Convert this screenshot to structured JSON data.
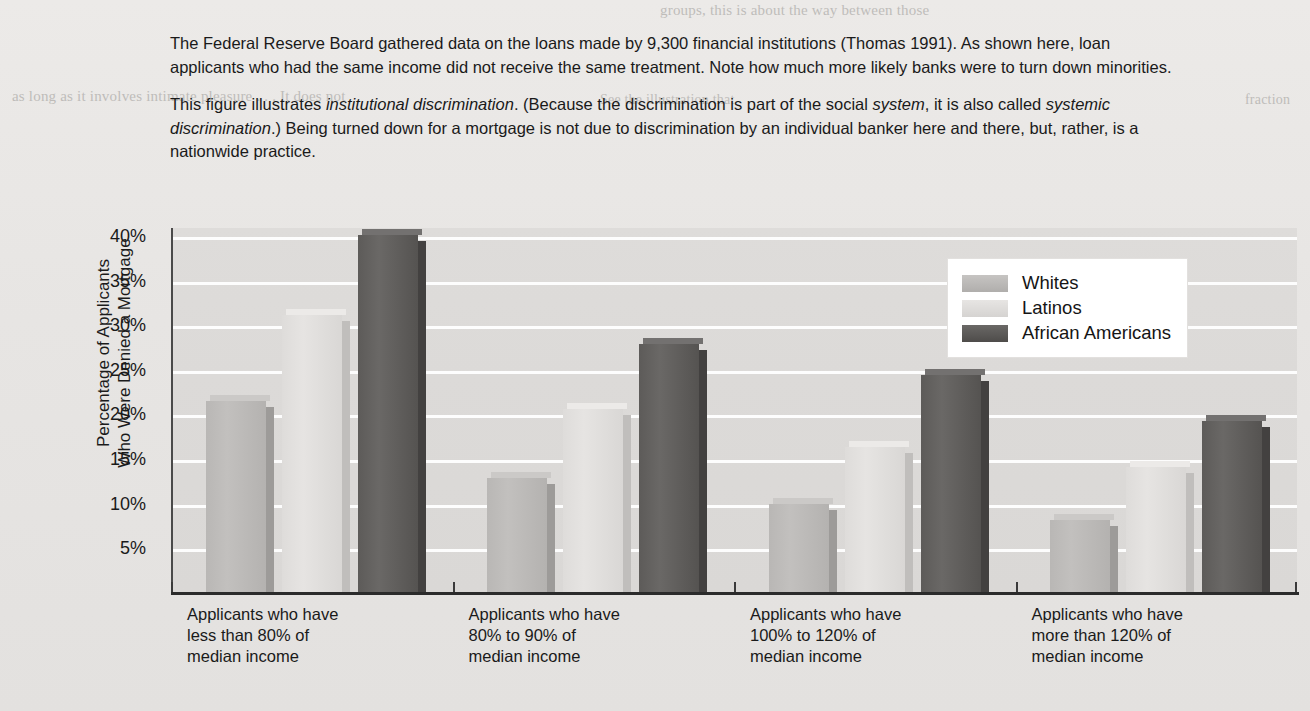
{
  "caption": {
    "paragraph1": "The Federal Reserve Board gathered data on the loans made by 9,300 financial institutions (Thomas 1991). As shown here, loan applicants who had the same income did not receive the same treatment. Note how much more likely banks were to turn down minorities.",
    "paragraph2_a": "This figure illustrates ",
    "paragraph2_i1": "institutional discrimination",
    "paragraph2_b": ". (Because the discrimination is part of the social ",
    "paragraph2_i2": "system",
    "paragraph2_c": ", it is also called ",
    "paragraph2_i3": "systemic discrimination",
    "paragraph2_d": ".) Being turned down for a mortgage is not due to discrimination by an individual banker here and there, but, rather, is a nationwide practice."
  },
  "ghost_text": {
    "top_right": "groups, this is about the way between those",
    "top_right2": "as long as it involves intimate pleasure . . . It does not",
    "left_mid": "See the illustration that",
    "right_mid": "fraction",
    "right_mid2": "is left",
    "right_mid3": "of this"
  },
  "chart_data": {
    "type": "bar",
    "title": "",
    "xlabel": "",
    "ylabel": "Percentage of Applicants Who Were Denied a Mortgage",
    "ylabel_line1": "Percentage of Applicants",
    "ylabel_line2": "Who Were Denied a Mortgage",
    "ylim": [
      0,
      41
    ],
    "yticks": [
      "40%",
      "35%",
      "30%",
      "25%",
      "20%",
      "15%",
      "10%",
      "5%"
    ],
    "ytick_values": [
      40,
      35,
      30,
      25,
      20,
      15,
      10,
      5
    ],
    "grid": true,
    "legend_position": "upper right",
    "categories": [
      "Applicants who have less than 80% of median income",
      "Applicants who have 80% to 90% of median income",
      "Applicants who have 100% to 120% of median income",
      "Applicants who have more than 120% of median income"
    ],
    "category_lines": [
      [
        "Applicants who have",
        "less than 80% of",
        "median income"
      ],
      [
        "Applicants who have",
        "80% to 90% of",
        "median income"
      ],
      [
        "Applicants who have",
        "100% to 120% of",
        "median income"
      ],
      [
        "Applicants who have",
        "more than 120% of",
        "median income"
      ]
    ],
    "series": [
      {
        "name": "Whites",
        "color": "#bdbbb9",
        "values": [
          21.4,
          12.8,
          9.9,
          8.1
        ]
      },
      {
        "name": "Latinos",
        "color": "#e2e0de",
        "values": [
          31.0,
          20.5,
          16.3,
          14.0
        ]
      },
      {
        "name": "African Americans",
        "color": "#5d5b59",
        "values": [
          40.0,
          27.8,
          24.3,
          19.2
        ]
      }
    ]
  }
}
